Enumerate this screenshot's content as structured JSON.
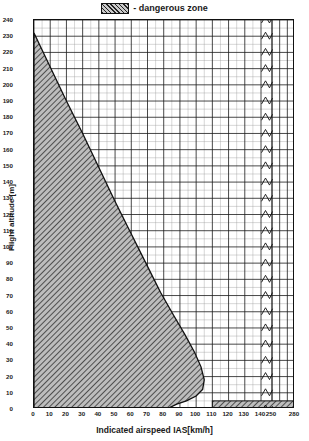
{
  "legend": {
    "swatch_name": "hatched-pattern-swatch",
    "text": "- dangerous zone"
  },
  "axes": {
    "y_title": "Flight altitude [m]",
    "x_title": "Indicated airspeed IAS[km/h]"
  },
  "chart_data": {
    "type": "area",
    "title": "",
    "subtitle": "",
    "xlabel": "Indicated airspeed IAS[km/h]",
    "ylabel": "Flight altitude [m]",
    "grid": true,
    "legend_position": "top-center",
    "legend_entries": [
      "- dangerous zone"
    ],
    "ylim": [
      0,
      240
    ],
    "y_major_step": 10,
    "y_minor_step": 5,
    "yticks": [
      0,
      10,
      20,
      30,
      40,
      50,
      60,
      70,
      80,
      90,
      100,
      110,
      120,
      130,
      140,
      150,
      160,
      170,
      180,
      190,
      200,
      210,
      220,
      230,
      240
    ],
    "x_axis_broken": true,
    "x_segment_main": [
      0,
      140
    ],
    "x_segment_tail": [
      250,
      280
    ],
    "x_major_step": 10,
    "x_minor_step": 5,
    "xticks": [
      0,
      10,
      20,
      30,
      40,
      50,
      60,
      70,
      80,
      90,
      100,
      110,
      120,
      130,
      140,
      250,
      280
    ],
    "series": [
      {
        "name": "dangerous zone",
        "fill": "hatched",
        "polygon": [
          [
            0,
            0
          ],
          [
            0,
            232
          ],
          [
            10,
            211
          ],
          [
            20,
            190
          ],
          [
            30,
            170
          ],
          [
            40,
            149
          ],
          [
            50,
            128
          ],
          [
            60,
            108
          ],
          [
            70,
            88
          ],
          [
            78,
            72
          ],
          [
            86,
            58
          ],
          [
            93,
            46
          ],
          [
            99,
            35
          ],
          [
            103,
            26
          ],
          [
            105,
            18
          ],
          [
            104,
            12
          ],
          [
            100,
            8
          ],
          [
            94,
            5
          ],
          [
            88,
            3
          ],
          [
            84,
            1
          ],
          [
            82,
            0
          ]
        ]
      },
      {
        "name": "low-altitude dangerous band",
        "fill": "hatched",
        "x_range": [
          110,
          280
        ],
        "y_range": [
          0,
          5
        ]
      }
    ],
    "annotations": [
      {
        "text": "axis break between 140 and 250 km/h",
        "type": "axis-break"
      }
    ]
  }
}
